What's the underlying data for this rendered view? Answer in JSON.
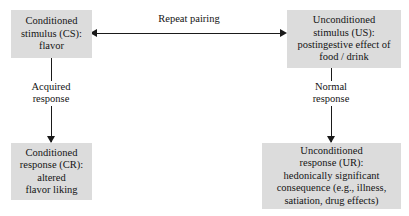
{
  "diagram": {
    "background_color": "#ffffff",
    "box_fill_color": "#dcdcdc",
    "line_color": "#1a1a1a",
    "nodes": [
      {
        "id": "cs",
        "name": "conditioned-stimulus",
        "text": "Conditioned\nstimulus (CS):\nflavor"
      },
      {
        "id": "us",
        "name": "unconditioned-stimulus",
        "text": "Unconditioned\nstimulus (US):\npostingestive effect of\nfood / drink"
      },
      {
        "id": "cr",
        "name": "conditioned-response",
        "text": "Conditioned\nresponse (CR):\naltered\nflavor liking"
      },
      {
        "id": "ur",
        "name": "unconditioned-response",
        "text": "Unconditioned\nresponse (UR):\nhedonically significant\nconsequence (e.g., illness,\nsatiation, drug effects)"
      }
    ],
    "edges": [
      {
        "id": "pairing",
        "name": "repeat-pairing-edge",
        "label": "Repeat pairing",
        "from": "cs",
        "to": "us",
        "style": "double-headed-horizontal-arrow"
      },
      {
        "id": "acquired",
        "name": "acquired-response-edge",
        "label": "Acquired\nresponse",
        "from": "cs",
        "to": "cr",
        "style": "downward-arrow"
      },
      {
        "id": "normal",
        "name": "normal-response-edge",
        "label": "Normal\nresponse",
        "from": "us",
        "to": "ur",
        "style": "downward-arrow"
      }
    ]
  }
}
